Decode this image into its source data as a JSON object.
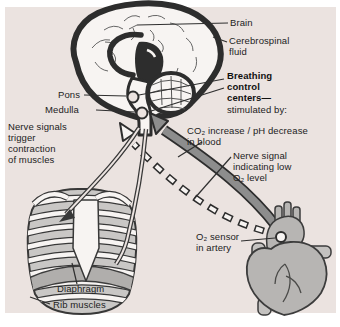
{
  "figure_subject": "Breathing control centers diagram (brain, rib cage, heart)",
  "colors": {
    "panel_background": "#ebe3e0",
    "outline_dark": "#2d2d2d",
    "signal_arrow_gray": "#8d8d8d",
    "organ_gray": "#b7b5b3",
    "rib_cage_gray": "#c9c7c5",
    "diaphragm_gray": "#b0aeac",
    "text": "#222222"
  },
  "labels": {
    "brain": "Brain",
    "cerebrospinal_fluid": "Cerebrospinal\nfluid",
    "pons": "Pons",
    "medulla": "Medulla",
    "breathing_control_centers": "Breathing\ncontrol\ncenters—",
    "stimulated_by": "stimulated by:",
    "nerve_signals_trigger": "Nerve signals\ntrigger\ncontraction\nof muscles",
    "co2_increase": "CO₂ increase / pH decrease\nin blood",
    "nerve_signal_low_o2": "Nerve signal\nindicating low\nO₂ level",
    "o2_sensor": "O₂ sensor\nin artery",
    "diaphragm": "Diaphragm",
    "rib_muscles": "Rib muscles"
  }
}
